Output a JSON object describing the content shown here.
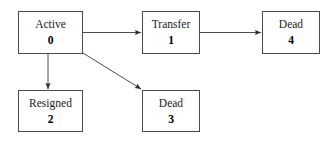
{
  "diagram": {
    "type": "state-transition-diagram",
    "background_color": "#ffffff",
    "line_color": "#4a4a4a",
    "text_color": "#1a1a1a",
    "nodes": [
      {
        "key": "active",
        "label": "Active",
        "id": "0"
      },
      {
        "key": "transfer",
        "label": "Transfer",
        "id": "1"
      },
      {
        "key": "resigned",
        "label": "Resigned",
        "id": "2"
      },
      {
        "key": "dead3",
        "label": "Dead",
        "id": "3"
      },
      {
        "key": "dead4",
        "label": "Dead",
        "id": "4"
      }
    ],
    "edges": [
      {
        "from": "active",
        "to": "transfer",
        "style": "straight-horizontal"
      },
      {
        "from": "transfer",
        "to": "dead4",
        "style": "straight-horizontal"
      },
      {
        "from": "active",
        "to": "resigned",
        "style": "straight-vertical"
      },
      {
        "from": "active",
        "to": "dead3",
        "style": "diagonal"
      }
    ]
  }
}
